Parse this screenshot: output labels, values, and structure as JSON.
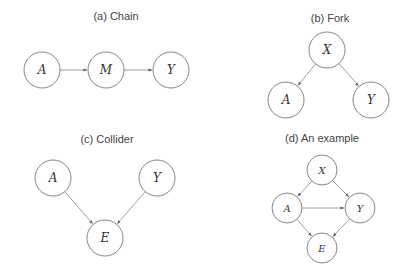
{
  "panels": [
    {
      "id": "a",
      "title": "(a) Chain",
      "title_pos": [
        116,
        20
      ],
      "r": 18,
      "nodes": [
        {
          "label": "A",
          "x": 42,
          "y": 70
        },
        {
          "label": "M",
          "x": 106,
          "y": 70
        },
        {
          "label": "Y",
          "x": 171,
          "y": 70
        }
      ],
      "edges": [
        [
          0,
          1
        ],
        [
          1,
          2
        ]
      ]
    },
    {
      "id": "b",
      "title": "(b) Fork",
      "title_pos": [
        330,
        22
      ],
      "r": 18,
      "nodes": [
        {
          "label": "X",
          "x": 327,
          "y": 50
        },
        {
          "label": "A",
          "x": 286,
          "y": 100
        },
        {
          "label": "Y",
          "x": 371,
          "y": 100
        }
      ],
      "edges": [
        [
          0,
          1
        ],
        [
          0,
          2
        ]
      ]
    },
    {
      "id": "c",
      "title": "(c) Collider",
      "title_pos": [
        107,
        143
      ],
      "r": 18,
      "nodes": [
        {
          "label": "A",
          "x": 53,
          "y": 178
        },
        {
          "label": "Y",
          "x": 157,
          "y": 178
        },
        {
          "label": "E",
          "x": 105,
          "y": 238
        }
      ],
      "edges": [
        [
          0,
          2
        ],
        [
          1,
          2
        ]
      ]
    },
    {
      "id": "d",
      "title": "(d) An example",
      "title_pos": [
        322,
        142
      ],
      "r": 15,
      "nodes": [
        {
          "label": "X",
          "x": 322,
          "y": 170
        },
        {
          "label": "A",
          "x": 287,
          "y": 208
        },
        {
          "label": "Y",
          "x": 360,
          "y": 208
        },
        {
          "label": "E",
          "x": 322,
          "y": 248
        }
      ],
      "edges": [
        [
          0,
          1
        ],
        [
          0,
          2
        ],
        [
          1,
          2
        ],
        [
          1,
          3
        ],
        [
          2,
          3
        ]
      ]
    }
  ]
}
